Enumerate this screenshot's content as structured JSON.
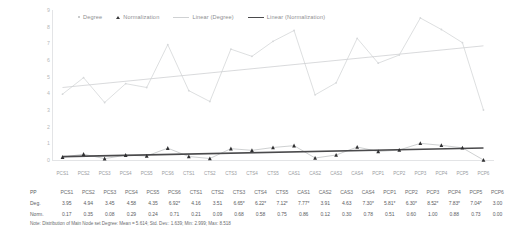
{
  "chart_data": {
    "type": "line",
    "title": "",
    "xlabel": "",
    "ylabel": "",
    "ylim": [
      0,
      9
    ],
    "yticks": [
      9,
      8,
      7,
      6,
      5,
      4,
      3,
      2,
      1,
      0
    ],
    "grid": false,
    "legend_position": "top",
    "categories": [
      "PCS1",
      "PCS2",
      "PCS3",
      "PCS4",
      "PCS5",
      "PCS6",
      "CTS1",
      "CTS2",
      "CTS3",
      "CTS4",
      "CTS5",
      "CAS1",
      "CAS2",
      "CAS3",
      "CAS4",
      "PCP1",
      "PCP2",
      "PCP3",
      "PCP4",
      "PCP5",
      "PCP6"
    ],
    "series": [
      {
        "name": "Degree",
        "color": "#c9cbcd",
        "marker": "dot",
        "values": [
          3.95,
          4.94,
          3.45,
          4.58,
          4.35,
          6.92,
          4.16,
          3.51,
          6.65,
          6.22,
          7.12,
          7.77,
          3.91,
          4.63,
          7.3,
          5.81,
          6.3,
          8.52,
          7.83,
          7.04,
          3.0
        ]
      },
      {
        "name": "Normalization",
        "color": "#3a3a3c",
        "marker": "triangle",
        "values": [
          0.17,
          0.35,
          0.08,
          0.29,
          0.24,
          0.71,
          0.21,
          0.09,
          0.68,
          0.58,
          0.75,
          0.86,
          0.12,
          0.3,
          0.78,
          0.51,
          0.6,
          1.0,
          0.88,
          0.73,
          0.0
        ]
      }
    ],
    "trendlines": [
      {
        "name": "Linear (Degree)",
        "color": "#cfd1d3",
        "start": 4.35,
        "end": 6.85
      },
      {
        "name": "Linear (Normalization)",
        "color": "#4a4a4c",
        "start": 0.2,
        "end": 0.72
      }
    ]
  },
  "legend": {
    "items": [
      {
        "label": "Degree",
        "mark": "dot-marker-icon"
      },
      {
        "label": "Normalization",
        "mark": "triangle-marker-icon"
      },
      {
        "label": "Linear (Degree)",
        "mark": "light-line-icon"
      },
      {
        "label": "Linear (Normalization)",
        "mark": "dark-line-icon"
      }
    ]
  },
  "table": {
    "corner_label": "PP",
    "columns": [
      "PCS1",
      "PCS2",
      "PCS3",
      "PCS4",
      "PCS5",
      "PCS6",
      "CTS1",
      "CTS2",
      "CTS3",
      "CTS4",
      "CTS5",
      "CAS1",
      "CAS2",
      "CAS3",
      "CAS4",
      "PCP1",
      "PCP2",
      "PCP3",
      "PCP4",
      "PCP5",
      "PCP6"
    ],
    "rows": [
      {
        "label": "Deg.",
        "values": [
          "3.95",
          "4.94",
          "3.45",
          "4.58",
          "4.35",
          "6.92*",
          "4.16",
          "3.51",
          "6.65*",
          "6.22*",
          "7.12*",
          "7.77*",
          "3.91",
          "4.63",
          "7.30*",
          "5.81*",
          "6.30*",
          "8.52*",
          "7.83*",
          "7.04*",
          "3.00"
        ]
      },
      {
        "label": "Norm.",
        "values": [
          "0.17",
          "0.35",
          "0.08",
          "0.29",
          "0.24",
          "0.71",
          "0.21",
          "0.09",
          "0.68",
          "0.58",
          "0.75",
          "0.86",
          "0.12",
          "0.30",
          "0.78",
          "0.51",
          "0.60",
          "1.00",
          "0.88",
          "0.73",
          "0.00"
        ]
      }
    ]
  },
  "note": "Note: Distribution of Main Node set Degree: Mean = 5.614; Std. Dev.: 1.639; Min: 2.999; Max: 8.518"
}
